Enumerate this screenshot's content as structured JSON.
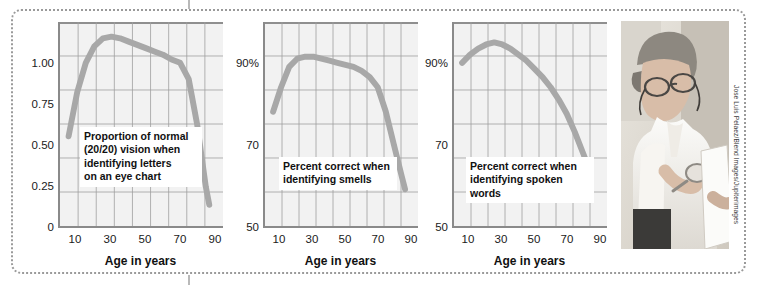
{
  "figure": {
    "credit": "Jose Luis Pelaez/Blend Images/Jupiterimages",
    "photo_alt": "older-woman-reading-with-magnifier-photo"
  },
  "chart_data": [
    {
      "type": "line",
      "title": "",
      "caption": "Proportion of normal\n(20/20) vision when\nidentifying letters\non an eye chart",
      "xlabel": "Age in years",
      "ylabel": "",
      "xlim": [
        0,
        95
      ],
      "ylim": [
        0,
        1.25
      ],
      "grid": true,
      "legend": "none",
      "xticks": [
        "10",
        "30",
        "50",
        "70",
        "90"
      ],
      "xtick_values": [
        10,
        30,
        50,
        70,
        90
      ],
      "yticks": [
        "0",
        "0.25",
        "0.50",
        "0.75",
        "1.00"
      ],
      "ytick_values": [
        0,
        0.25,
        0.5,
        0.75,
        1.0
      ],
      "x": [
        5,
        10,
        15,
        20,
        25,
        30,
        35,
        40,
        45,
        50,
        55,
        60,
        65,
        70,
        75,
        80,
        85,
        87
      ],
      "values": [
        0.55,
        0.82,
        1.0,
        1.1,
        1.15,
        1.16,
        1.15,
        1.13,
        1.11,
        1.09,
        1.07,
        1.05,
        1.02,
        1.0,
        0.9,
        0.62,
        0.24,
        0.13
      ]
    },
    {
      "type": "line",
      "title": "",
      "caption": "Percent correct when\nidentifying smells",
      "xlabel": "Age in years",
      "ylabel": "",
      "xlim": [
        0,
        95
      ],
      "ylim": [
        50,
        100
      ],
      "grid": true,
      "legend": "none",
      "xticks": [
        "10",
        "30",
        "50",
        "70",
        "90"
      ],
      "xtick_values": [
        10,
        30,
        50,
        70,
        90
      ],
      "yticks": [
        "50",
        "70",
        "90%"
      ],
      "ytick_values": [
        50,
        70,
        90
      ],
      "x": [
        5,
        10,
        15,
        20,
        25,
        30,
        35,
        40,
        45,
        50,
        55,
        60,
        65,
        70,
        75,
        80,
        85,
        87
      ],
      "values": [
        78,
        84,
        89,
        91,
        91.5,
        91.5,
        91,
        90.5,
        90,
        89.5,
        89,
        88,
        86.5,
        84,
        78,
        70,
        62,
        59
      ]
    },
    {
      "type": "line",
      "title": "",
      "caption": "Percent correct when\nidentifying spoken words",
      "xlabel": "Age in years",
      "ylabel": "",
      "xlim": [
        0,
        95
      ],
      "ylim": [
        50,
        100
      ],
      "grid": true,
      "legend": "none",
      "xticks": [
        "10",
        "30",
        "50",
        "70",
        "90"
      ],
      "xtick_values": [
        10,
        30,
        50,
        70,
        90
      ],
      "yticks": [
        "50",
        "70",
        "90%"
      ],
      "ytick_values": [
        50,
        70,
        90
      ],
      "x": [
        5,
        10,
        15,
        20,
        25,
        30,
        35,
        40,
        45,
        50,
        55,
        60,
        65,
        70,
        75,
        80,
        83
      ],
      "values": [
        90,
        92,
        93.5,
        94.5,
        95,
        94.5,
        93.5,
        92,
        90.5,
        88.5,
        86.5,
        84,
        81,
        77.5,
        73,
        68,
        65
      ]
    }
  ],
  "colors": {
    "curve": "#a8a8a8",
    "plot_bg": "#f2f2f2",
    "grid": "#9e9e9e",
    "axis": "#8a8a8a",
    "border": "#9a9a9a",
    "text": "#111111"
  }
}
